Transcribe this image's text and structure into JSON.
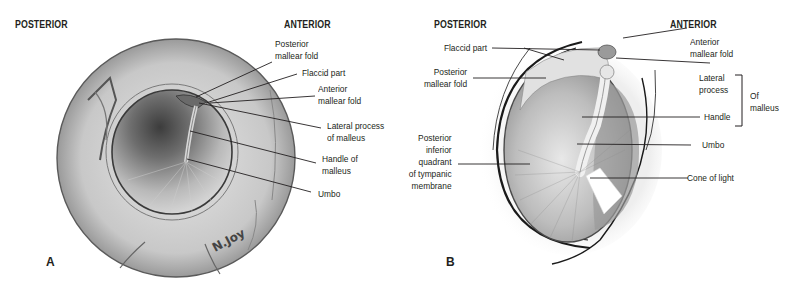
{
  "figure": {
    "panels": [
      {
        "id": "A",
        "letter": "A",
        "orientation": {
          "left": "POSTERIOR",
          "right": "ANTERIOR"
        },
        "view": "otoscopic",
        "artist_signature": "N.Joy",
        "labels": [
          {
            "text": "Posterior\nmallear fold"
          },
          {
            "text": "Flaccid part"
          },
          {
            "text": "Anterior\nmallear fold"
          },
          {
            "text": "Lateral process\nof malleus"
          },
          {
            "text": "Handle of\nmalleus"
          },
          {
            "text": "Umbo"
          }
        ]
      },
      {
        "id": "B",
        "letter": "B",
        "orientation": {
          "left": "POSTERIOR",
          "right": "ANTERIOR"
        },
        "view": "schematic",
        "labels": [
          {
            "text": "Flaccid part"
          },
          {
            "text": "Posterior\nmallear fold"
          },
          {
            "text": "Posterior\ninferior\nquadrant\nof tympanic\nmembrane"
          },
          {
            "text": "Anterior\nmallear fold"
          },
          {
            "text": "Lateral\nprocess"
          },
          {
            "text": "Handle"
          },
          {
            "text": "Umbo"
          },
          {
            "text": "Cone of light"
          }
        ],
        "bracket_label": "Of\nmalleus"
      }
    ],
    "colors": {
      "text": "#231f20",
      "leader_line": "#231f20",
      "tissue_light": "#d9d9d9",
      "tissue_mid": "#a8a8a8",
      "tissue_dark": "#4a4a4a",
      "background": "#ffffff"
    }
  }
}
